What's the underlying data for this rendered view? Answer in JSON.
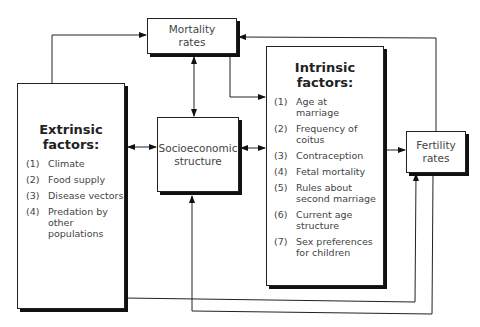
{
  "diagram": {
    "nodes": {
      "mortality": {
        "label_line1": "Mortality",
        "label_line2": "rates"
      },
      "socioeconomic": {
        "label_line1": "Socioeconomic",
        "label_line2": "structure"
      },
      "fertility": {
        "label_line1": "Fertility",
        "label_line2": "rates"
      },
      "extrinsic": {
        "title_line1": "Extrinsic",
        "title_line2": "factors:",
        "items": [
          {
            "num": "(1)",
            "text": "Climate"
          },
          {
            "num": "(2)",
            "text": "Food supply"
          },
          {
            "num": "(3)",
            "text": "Disease vectors"
          },
          {
            "num": "(4)",
            "text": "Predation by other populations"
          }
        ]
      },
      "intrinsic": {
        "title_line1": "Intrinsic",
        "title_line2": "factors:",
        "items": [
          {
            "num": "(1)",
            "text": "Age at marriage"
          },
          {
            "num": "(2)",
            "text": "Frequency of coitus"
          },
          {
            "num": "(3)",
            "text": "Contraception"
          },
          {
            "num": "(4)",
            "text": "Fetal mortality"
          },
          {
            "num": "(5)",
            "text": "Rules about second marriage"
          },
          {
            "num": "(6)",
            "text": "Current age structure"
          },
          {
            "num": "(7)",
            "text": "Sex preferences for children"
          }
        ]
      }
    },
    "edges": [
      {
        "from": "Extrinsic factors",
        "to": "Mortality rates",
        "direction": "one-way"
      },
      {
        "from": "Fertility rates",
        "to": "Mortality rates",
        "direction": "one-way"
      },
      {
        "from": "Mortality rates",
        "to": "Socioeconomic structure",
        "direction": "two-way"
      },
      {
        "from": "Mortality rates",
        "to": "Intrinsic factors",
        "direction": "one-way"
      },
      {
        "from": "Extrinsic factors",
        "to": "Socioeconomic structure",
        "direction": "two-way"
      },
      {
        "from": "Socioeconomic structure",
        "to": "Intrinsic factors",
        "direction": "two-way"
      },
      {
        "from": "Intrinsic factors",
        "to": "Fertility rates",
        "direction": "one-way"
      },
      {
        "from": "Extrinsic factors",
        "to": "Fertility rates",
        "direction": "one-way"
      },
      {
        "from": "Fertility rates",
        "to": "Socioeconomic structure",
        "direction": "one-way"
      }
    ]
  }
}
